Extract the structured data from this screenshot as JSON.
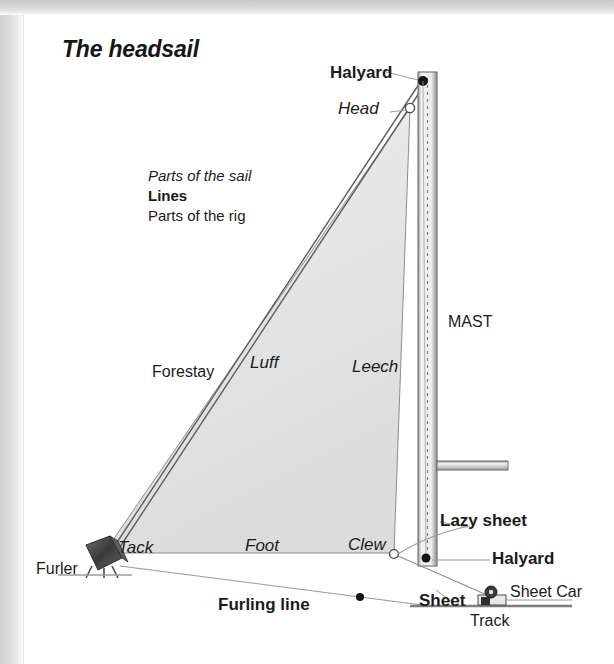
{
  "page": {
    "title": "The headsail",
    "background_color": "#ffffff",
    "ink_color": "#1b1b1b",
    "sail_fill_color": "#e3e3e3",
    "mast_color": "#6b6b6b",
    "fitting_color": "#4a4a4a"
  },
  "key": {
    "sail_parts": "Parts of the sail",
    "lines": "Lines",
    "rig_parts": "Parts of the rig"
  },
  "labels": {
    "halyard_top": "Halyard",
    "head": "Head",
    "mast": "MAST",
    "forestay": "Forestay",
    "luff": "Luff",
    "leech": "Leech",
    "tack": "Tack",
    "foot": "Foot",
    "clew": "Clew",
    "furler": "Furler",
    "furling_line": "Furling line",
    "lazy_sheet": "Lazy sheet",
    "halyard_bottom": "Halyard",
    "sheet": "Sheet",
    "sheet_car": "Sheet Car",
    "track": "Track"
  },
  "diagram": {
    "sail": {
      "head_point": [
        410,
        108
      ],
      "tack_point": [
        104,
        553
      ],
      "clew_point": [
        394,
        553
      ]
    },
    "mast": {
      "x": 418,
      "y_top": 72,
      "width": 19,
      "y_bottom": 566
    },
    "masthead_dot": [
      423,
      81
    ],
    "head_ring": [
      410,
      108
    ],
    "tack_ring": [
      110,
      551
    ],
    "clew_ring": [
      394,
      553
    ],
    "mast_base_dot": [
      426,
      558
    ],
    "boom": {
      "x_start": 437,
      "x_end": 508,
      "y": 461,
      "height": 9
    },
    "track": {
      "x_start": 410,
      "x_end": 570,
      "y": 605
    },
    "sheet_car": [
      492,
      597
    ],
    "furler_drum": [
      100,
      557
    ],
    "furling_line_dot": [
      360,
      597
    ],
    "deck_line": {
      "x_start": 60,
      "x_end": 120,
      "y": 573
    }
  }
}
